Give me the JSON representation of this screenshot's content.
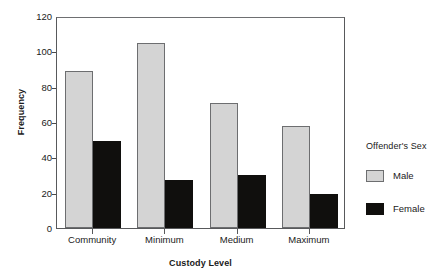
{
  "chart_data": {
    "type": "bar",
    "title": "",
    "xlabel": "Custody Level",
    "ylabel": "Frequency",
    "categories": [
      "Community",
      "Minimum",
      "Medium",
      "Maximum"
    ],
    "series": [
      {
        "name": "Male",
        "color": "#d4d4d4",
        "values": [
          89,
          105,
          71,
          58
        ]
      },
      {
        "name": "Female",
        "color": "#100f0d",
        "values": [
          49,
          27,
          30,
          19
        ]
      }
    ],
    "legend": {
      "title": "Offender's Sex",
      "position": "right",
      "entries": [
        "Male",
        "Female"
      ]
    },
    "ylim": [
      0,
      120
    ],
    "yticks": [
      0,
      20,
      40,
      60,
      80,
      100,
      120
    ],
    "ytick_labels": [
      "0",
      "20",
      "40",
      "60",
      "80",
      "100",
      "120"
    ],
    "grid": false,
    "grouping": "grouped"
  },
  "axes": {
    "y_title": "Frequency",
    "x_title": "Custody Level"
  },
  "legend": {
    "title": "Offender's Sex",
    "male_label": "Male",
    "female_label": "Female"
  }
}
